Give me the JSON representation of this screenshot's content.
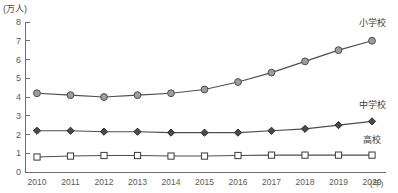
{
  "chart_data": {
    "type": "line",
    "title": "",
    "subtitle": "",
    "xlabel": "(年)",
    "ylabel": "(万人)",
    "x": [
      2010,
      2011,
      2012,
      2013,
      2014,
      2015,
      2016,
      2017,
      2018,
      2019,
      2020
    ],
    "categories": [
      "2010",
      "2011",
      "2012",
      "2013",
      "2014",
      "2015",
      "2016",
      "2017",
      "2018",
      "2019",
      "2020"
    ],
    "xlim": [
      2010,
      2020
    ],
    "ylim": [
      0,
      8
    ],
    "yticks": [
      0,
      1,
      2,
      3,
      4,
      5,
      6,
      7,
      8
    ],
    "ytick_labels": [
      "0",
      "1",
      "2",
      "3",
      "4",
      "5",
      "6",
      "7",
      "8"
    ],
    "grid": false,
    "legend_position": "right-inline",
    "series": [
      {
        "name": "小学校",
        "label": "小学校",
        "marker": "circle",
        "marker_fill": "#9e9e9e",
        "marker_stroke": "#4d4d4d",
        "line_color": "#4d4d4d",
        "values": [
          4.2,
          4.1,
          4.0,
          4.1,
          4.2,
          4.4,
          4.8,
          5.3,
          5.9,
          6.5,
          7.0
        ],
        "label_x": 2020,
        "label_y": 7.8
      },
      {
        "name": "中学校",
        "label": "中学校",
        "marker": "diamond",
        "marker_fill": "#4a4a4a",
        "marker_stroke": "#2e2e2e",
        "line_color": "#4d4d4d",
        "values": [
          2.2,
          2.2,
          2.15,
          2.15,
          2.1,
          2.1,
          2.1,
          2.2,
          2.3,
          2.5,
          2.7
        ],
        "label_x": 2020,
        "label_y": 3.4
      },
      {
        "name": "高校",
        "label": "高校",
        "marker": "square",
        "marker_fill": "#ffffff",
        "marker_stroke": "#3a3a3a",
        "line_color": "#4d4d4d",
        "values": [
          0.8,
          0.85,
          0.88,
          0.88,
          0.85,
          0.85,
          0.88,
          0.9,
          0.9,
          0.9,
          0.9
        ],
        "label_x": 2020,
        "label_y": 1.55
      }
    ]
  },
  "colors": {
    "background": "#ffffff",
    "axis": "#6e6e6e",
    "text": "#5a5a5a",
    "label_text": "#3d3d3d"
  }
}
